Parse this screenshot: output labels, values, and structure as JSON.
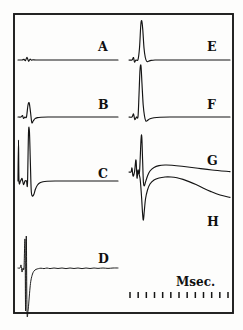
{
  "figure": {
    "kind": "oscilloscope-trace-panel",
    "background_color": "#fdfdfc",
    "ink_color": "#141414",
    "frame": {
      "x": 14,
      "y": 14,
      "width": 219,
      "height": 299,
      "stroke": "#1a1a1a"
    },
    "axis_caption": "Msec.",
    "tick_count": 13
  },
  "chart_data": {
    "type": "line",
    "title": "",
    "subtitle": "",
    "xlabel": "Msec.",
    "ylabel": "",
    "grid": false,
    "legend_position": "inline-right",
    "annotations": [
      "Msec."
    ],
    "axis_note": "time calibration row of 13 evenly spaced tick marks at lower right",
    "panels": [
      {
        "label": "A",
        "column": "left",
        "row": 1,
        "label_x": 98,
        "label_y": 41,
        "baseline_y": 60,
        "x_start": 18,
        "x_end": 118,
        "description": "flat baseline with small biphasic stimulus artifact near onset",
        "points": [
          [
            18,
            60
          ],
          [
            22,
            60
          ],
          [
            24,
            59.4
          ],
          [
            25.5,
            60.6
          ],
          [
            27,
            57.2
          ],
          [
            28.5,
            61.2
          ],
          [
            30,
            59.2
          ],
          [
            31.5,
            60.2
          ],
          [
            33,
            59.8
          ],
          [
            36,
            60
          ],
          [
            48,
            60
          ],
          [
            70,
            60
          ],
          [
            95,
            60
          ],
          [
            118,
            60
          ]
        ]
      },
      {
        "label": "B",
        "column": "left",
        "row": 2,
        "label_x": 98,
        "label_y": 99,
        "baseline_y": 117,
        "x_start": 18,
        "x_end": 118,
        "description": "small stimulus artifact then a sharp upward spike with brief negative undershoot",
        "points": [
          [
            18,
            117
          ],
          [
            21,
            117
          ],
          [
            22.5,
            115.5
          ],
          [
            23.5,
            118.5
          ],
          [
            25,
            117
          ],
          [
            26.5,
            116.8
          ],
          [
            28,
            105
          ],
          [
            29.2,
            103
          ],
          [
            30.5,
            112
          ],
          [
            31.8,
            122.5
          ],
          [
            33.2,
            121
          ],
          [
            35,
            118.6
          ],
          [
            37.5,
            117.6
          ],
          [
            41,
            117.2
          ],
          [
            48,
            117
          ],
          [
            62,
            117
          ],
          [
            85,
            117
          ],
          [
            118,
            117
          ]
        ]
      },
      {
        "label": "C",
        "column": "left",
        "row": 3,
        "label_x": 98,
        "label_y": 168,
        "baseline_y": 181,
        "x_start": 18,
        "x_end": 118,
        "description": "stimulus artifact, very tall clipped upward spike, large negative deflection, recovery to baseline",
        "points": [
          [
            18,
            181
          ],
          [
            18.5,
            140
          ],
          [
            19,
            181
          ],
          [
            20.5,
            181
          ],
          [
            22,
            178.5
          ],
          [
            23.5,
            184.5
          ],
          [
            25,
            181
          ],
          [
            26.5,
            181
          ],
          [
            27.5,
            183.5
          ],
          [
            28.5,
            133
          ],
          [
            29.4,
            131
          ],
          [
            30.3,
            160
          ],
          [
            31.2,
            190
          ],
          [
            32.3,
            196
          ],
          [
            33.8,
            194.5
          ],
          [
            35.5,
            189
          ],
          [
            37.5,
            185
          ],
          [
            40,
            182.8
          ],
          [
            43,
            181.8
          ],
          [
            47,
            181.3
          ],
          [
            55,
            181
          ],
          [
            70,
            181
          ],
          [
            92,
            181
          ],
          [
            118,
            181
          ]
        ]
      },
      {
        "label": "D",
        "column": "left",
        "row": 4,
        "label_x": 98,
        "label_y": 253,
        "baseline_y": 268,
        "x_start": 18,
        "x_end": 118,
        "description": "stimulus artifact, extremely tall spike running off-scale downward, slow noisy return to baseline",
        "points": [
          [
            18,
            268
          ],
          [
            20,
            268
          ],
          [
            21,
            265
          ],
          [
            22,
            272
          ],
          [
            23,
            268
          ],
          [
            24,
            268
          ],
          [
            25,
            240
          ],
          [
            25.6,
            311
          ],
          [
            26.3,
            236
          ],
          [
            27,
            311
          ],
          [
            28,
            311
          ],
          [
            29,
            300
          ],
          [
            30,
            288
          ],
          [
            31,
            280
          ],
          [
            32.5,
            274
          ],
          [
            34,
            271
          ],
          [
            36,
            269.4
          ],
          [
            38.5,
            268.6
          ],
          [
            41,
            268.2
          ],
          [
            44,
            268.6
          ],
          [
            47,
            268
          ],
          [
            50,
            268.6
          ],
          [
            54,
            268
          ],
          [
            58,
            268.5
          ],
          [
            62,
            268
          ],
          [
            66,
            268.6
          ],
          [
            70,
            268
          ],
          [
            74,
            268.5
          ],
          [
            78,
            268
          ],
          [
            82,
            268.6
          ],
          [
            86,
            268
          ],
          [
            90,
            268.5
          ],
          [
            94,
            268
          ],
          [
            98,
            268.4
          ],
          [
            103,
            268
          ],
          [
            108,
            268.4
          ],
          [
            113,
            268
          ],
          [
            118,
            268
          ]
        ]
      },
      {
        "label": "E",
        "column": "right",
        "row": 1,
        "label_x": 207,
        "label_y": 41,
        "baseline_y": 60,
        "x_start": 129,
        "x_end": 230,
        "description": "stimulus artifact then a tall narrow upward spike returning smoothly to baseline",
        "points": [
          [
            129,
            60
          ],
          [
            132,
            60
          ],
          [
            133.5,
            57.5
          ],
          [
            134.5,
            62
          ],
          [
            136,
            60
          ],
          [
            138,
            59.6
          ],
          [
            139.5,
            48
          ],
          [
            140.8,
            25
          ],
          [
            141.8,
            21
          ],
          [
            142.8,
            30
          ],
          [
            144,
            48
          ],
          [
            145.3,
            57.5
          ],
          [
            146.8,
            61.5
          ],
          [
            148.5,
            61.2
          ],
          [
            151,
            60.4
          ],
          [
            155,
            60
          ],
          [
            165,
            60
          ],
          [
            185,
            60
          ],
          [
            210,
            60
          ],
          [
            230,
            60
          ]
        ]
      },
      {
        "label": "F",
        "column": "right",
        "row": 2,
        "label_x": 207,
        "label_y": 99,
        "baseline_y": 117,
        "x_start": 129,
        "x_end": 230,
        "description": "stimulus artifact then a very tall narrow spike (off top of trace) with small undershoot",
        "points": [
          [
            129,
            117
          ],
          [
            132,
            117
          ],
          [
            133.5,
            114
          ],
          [
            134.8,
            119.5
          ],
          [
            136.5,
            117
          ],
          [
            138,
            116.6
          ],
          [
            139,
            95
          ],
          [
            140,
            70
          ],
          [
            141,
            66
          ],
          [
            142,
            84
          ],
          [
            143.2,
            105
          ],
          [
            144.5,
            116
          ],
          [
            145.8,
            121
          ],
          [
            147.5,
            120.4
          ],
          [
            150,
            118.8
          ],
          [
            154,
            117.8
          ],
          [
            160,
            117.2
          ],
          [
            170,
            117
          ],
          [
            190,
            117
          ],
          [
            212,
            117
          ],
          [
            230,
            117
          ]
        ]
      },
      {
        "label": "G",
        "column": "right",
        "row": 3,
        "label_x": 207,
        "label_y": 155,
        "baseline_y": 172,
        "x_start": 129,
        "x_end": 230,
        "description": "biphasic stimulus artifact, spike running off top, sharp negative notch, then a long slowly decaying plateau",
        "points": [
          [
            129,
            172
          ],
          [
            131,
            172
          ],
          [
            132,
            168
          ],
          [
            133,
            176
          ],
          [
            134.5,
            172
          ],
          [
            136,
            160
          ],
          [
            137,
            178
          ],
          [
            138,
            170
          ],
          [
            139.5,
            172
          ],
          [
            141,
            140
          ],
          [
            141.8,
            137
          ],
          [
            142.6,
            160
          ],
          [
            143.4,
            182
          ],
          [
            144.3,
            186
          ],
          [
            145.5,
            182
          ],
          [
            147.5,
            176
          ],
          [
            150,
            171
          ],
          [
            154,
            167.5
          ],
          [
            159,
            165.6
          ],
          [
            165,
            165
          ],
          [
            172,
            165.2
          ],
          [
            182,
            166.2
          ],
          [
            196,
            168
          ],
          [
            212,
            170
          ],
          [
            230,
            171.6
          ]
        ]
      },
      {
        "label": "H",
        "column": "right",
        "row": 4,
        "label_x": 207,
        "label_y": 216,
        "baseline_y": 172,
        "x_start": 138,
        "x_end": 230,
        "description": "large slow negative deflection dropping far below baseline, then a broad rounded positive hump decaying slowly",
        "points": [
          [
            138,
            172
          ],
          [
            140,
            178
          ],
          [
            141.5,
            196
          ],
          [
            142.6,
            214
          ],
          [
            143.4,
            220
          ],
          [
            144.3,
            211
          ],
          [
            145.5,
            199
          ],
          [
            147.5,
            190
          ],
          [
            150,
            184
          ],
          [
            154,
            180
          ],
          [
            159,
            178
          ],
          [
            165,
            177
          ],
          [
            171,
            177
          ],
          [
            177,
            177.8
          ],
          [
            183,
            179.4
          ],
          [
            189,
            181.6
          ],
          [
            196,
            184.6
          ],
          [
            203,
            188
          ],
          [
            211,
            191.6
          ],
          [
            220,
            195
          ],
          [
            230,
            197.4
          ]
        ]
      }
    ],
    "time_ticks": {
      "y": 292,
      "x_start": 130,
      "x_end": 228,
      "count": 13,
      "height": 6
    }
  }
}
